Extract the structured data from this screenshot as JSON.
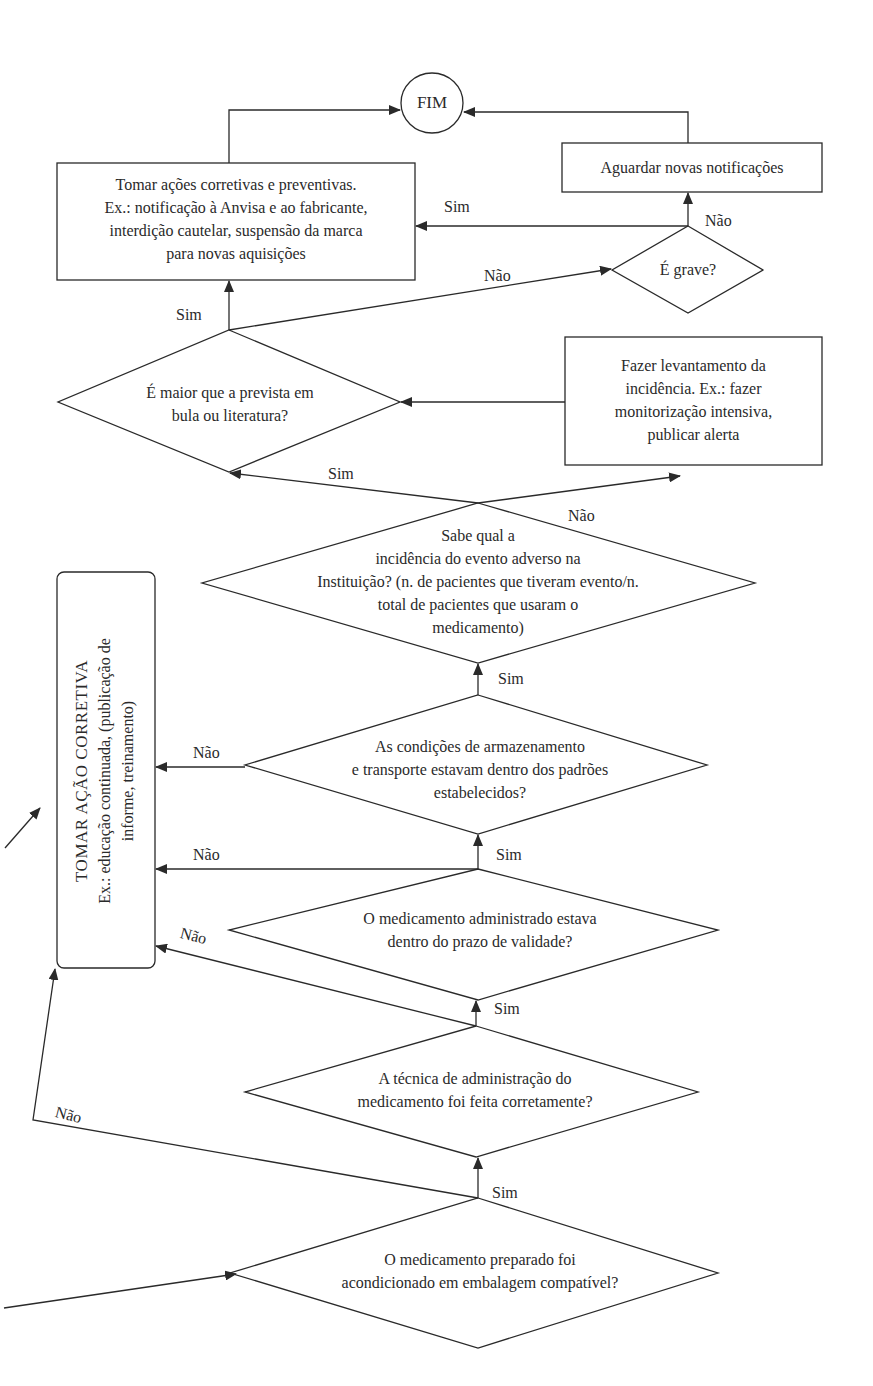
{
  "colors": {
    "line": "#2a2a2a",
    "background": "#ffffff"
  },
  "nodes": {
    "end": {
      "label": "FIM"
    },
    "corrective_preventive": {
      "lines": [
        "Tomar ações corretivas e preventivas.",
        "Ex.: notificação à Anvisa e ao fabricante,",
        "interdição cautelar, suspensão da marca",
        "para novas aquisições"
      ]
    },
    "wait_notifications": {
      "label": "Aguardar novas notificações"
    },
    "is_serious": {
      "label": "É grave?"
    },
    "greater_than_expected": {
      "lines": [
        "É maior que a prevista em",
        "bula ou literatura?"
      ]
    },
    "survey_incidence": {
      "lines": [
        "Fazer levantamento da",
        "incidência. Ex.: fazer",
        "monitorização intensiva,",
        "publicar alerta"
      ]
    },
    "knows_incidence": {
      "lines": [
        "Sabe qual a",
        "incidência do evento adverso na",
        "Instituição? (n. de pacientes que tiveram evento/n.",
        "total de pacientes que usaram o",
        "medicamento)"
      ]
    },
    "corrective_action": {
      "title": "TOMAR AÇÃO CORRETIVA",
      "lines": [
        "Ex.: educação continuada, (publicação de",
        "informe, treinamento)"
      ]
    },
    "storage_conditions": {
      "lines": [
        "As condições de armazenamento",
        "e transporte estavam dentro dos padrões",
        "estabelecidos?"
      ]
    },
    "within_expiry": {
      "lines": [
        "O medicamento administrado estava",
        "dentro do prazo de validade?"
      ]
    },
    "administration_technique": {
      "lines": [
        "A técnica de administração do",
        "medicamento foi feita corretamente?"
      ]
    },
    "compatible_packaging": {
      "lines": [
        "O medicamento preparado foi",
        "acondicionado em embalagem compatível?"
      ]
    }
  },
  "edge_labels": {
    "grave_sim": "Sim",
    "grave_nao": "Não",
    "maior_nao": "Não",
    "maior_sim": "Sim",
    "sabe_sim": "Sim",
    "sabe_nao": "Não",
    "storage_sim": "Sim",
    "storage_nao": "Não",
    "expiry_sim": "Sim",
    "expiry_nao": "Não",
    "technique_sim": "Sim",
    "technique_nao": "Não",
    "packaging_sim": "Sim",
    "packaging_nao": "Não"
  }
}
